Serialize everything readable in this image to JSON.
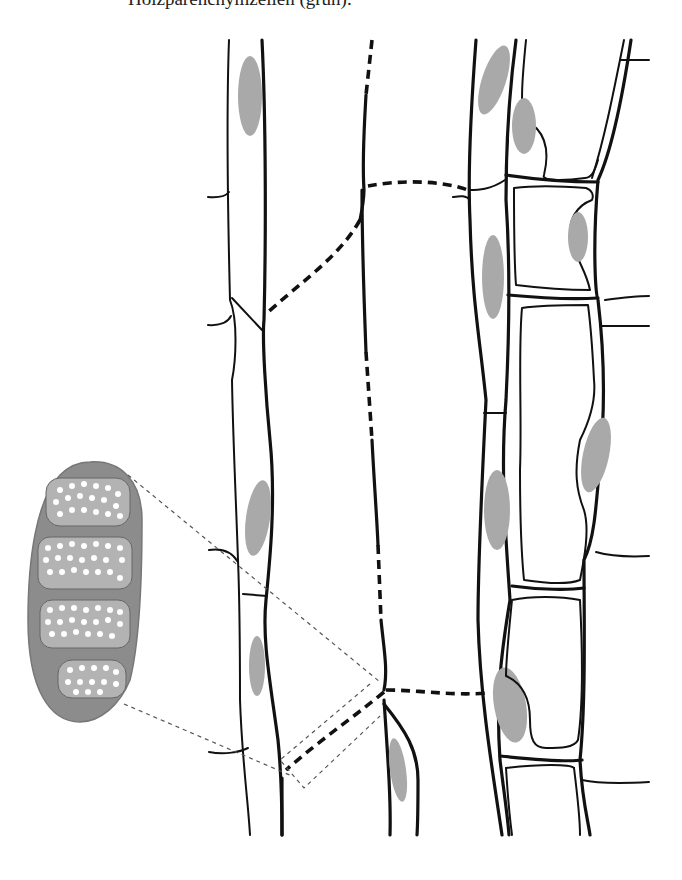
{
  "caption": {
    "text": "Holzparenchymzellen (grün)."
  },
  "figure": {
    "type": "plant tissue longitudinal section",
    "inset": "magnified pit-pair / chloroplast-like organelle with 4 compartments and white dots",
    "colors": {
      "wall": "#111111",
      "nucleus": "#a9a9a9",
      "organelle_outer": "#8c8c8c",
      "organelle_inner": "#b3b3b3",
      "dots": "#ffffff",
      "background": "#ffffff"
    }
  }
}
